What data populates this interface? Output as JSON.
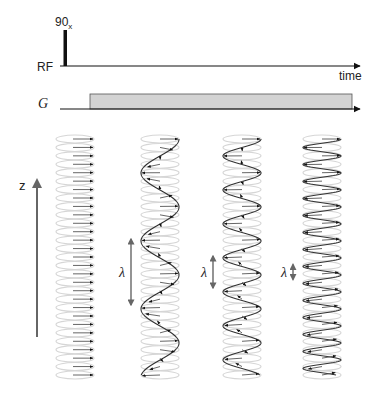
{
  "pulse_sequence": {
    "rf_label": "RF",
    "pulse_label": "90",
    "pulse_subscript": "x",
    "time_label": "time",
    "gradient_label": "G"
  },
  "axis": {
    "label": "z"
  },
  "wavelength_symbol": "λ",
  "colors": {
    "ink": "#111111",
    "gradient_fill": "#d3d3d3",
    "ellipse": "#d6d6d6",
    "vector": "#555555",
    "axis": "#666666"
  },
  "columns": [
    {
      "name": "uniform",
      "relative_wavelength": null,
      "show_lambda": false
    },
    {
      "name": "long-wavelength",
      "relative_wavelength": 1.0,
      "show_lambda": true
    },
    {
      "name": "medium-wavelength",
      "relative_wavelength": 0.5,
      "show_lambda": true
    },
    {
      "name": "short-wavelength",
      "relative_wavelength": 0.25,
      "show_lambda": true
    }
  ],
  "slices_per_column": 29
}
